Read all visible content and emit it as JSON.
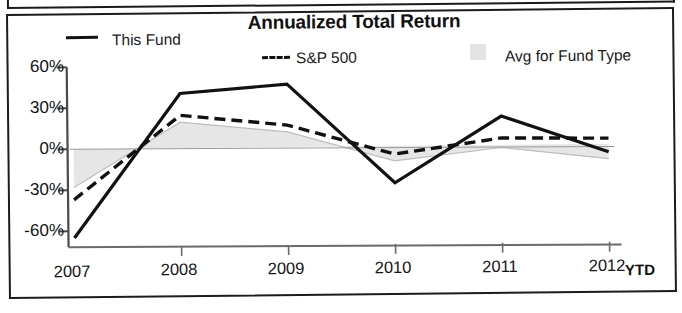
{
  "chart_data": {
    "type": "line",
    "title": "Annualized Total Return",
    "xlabel": "",
    "ylabel": "",
    "categories": [
      "2007",
      "2008",
      "2009",
      "2010",
      "2011",
      "2012"
    ],
    "x_axis_suffix": "YTD",
    "ytick_labels": [
      "60%",
      "30%",
      "0%",
      "-30%",
      "-60%"
    ],
    "ytick_values": [
      60,
      30,
      0,
      -30,
      -60
    ],
    "ylim": [
      -70,
      62
    ],
    "grid": false,
    "legend_position": "top",
    "series": [
      {
        "name": "This Fund",
        "style": "solid",
        "color": "#111111",
        "values": [
          -65,
          40,
          46,
          -27,
          21,
          -6
        ]
      },
      {
        "name": "S&P 500",
        "style": "dashed",
        "color": "#111111",
        "values": [
          -37,
          24,
          16,
          -6,
          5,
          4
        ]
      },
      {
        "name": "Avg for Fund Type",
        "style": "band",
        "color": "#e4e4e4",
        "values": [
          -28,
          19,
          11,
          -11,
          -2,
          -11
        ]
      }
    ],
    "band_baseline": 0
  },
  "legend": {
    "items": [
      {
        "label": "This Fund",
        "marker": "solid-line-marker"
      },
      {
        "label": "S&P 500",
        "marker": "dashed-line-marker"
      },
      {
        "label": "Avg for Fund Type",
        "marker": "gray-swatch-marker"
      }
    ]
  },
  "axes": {
    "y": {
      "t0": "60%",
      "t1": "30%",
      "t2": "0%",
      "t3": "-30%",
      "t4": "-60%"
    },
    "x": {
      "t0": "2007",
      "t1": "2008",
      "t2": "2009",
      "t3": "2010",
      "t4": "2011",
      "t5": "2012",
      "suffix": "YTD"
    }
  },
  "colors": {
    "ink": "#111111",
    "band": "#e4e4e4",
    "axis": "#4a4a4a"
  }
}
